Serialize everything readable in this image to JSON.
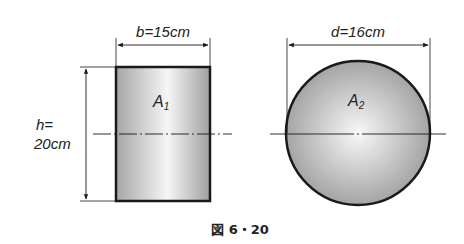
{
  "figure": {
    "caption": "図 6・20"
  },
  "rectangle": {
    "width_label": "b=15cm",
    "height_label_line1": "h=",
    "height_label_line2": "20cm",
    "area_label": "A",
    "area_subscript": "1"
  },
  "circle": {
    "diameter_label": "d=16cm",
    "area_label": "A",
    "area_subscript": "2"
  },
  "colors": {
    "outline": "#1a1a1a",
    "fill_edge": "#a8a8a8",
    "fill_center": "#f4f4f4"
  }
}
